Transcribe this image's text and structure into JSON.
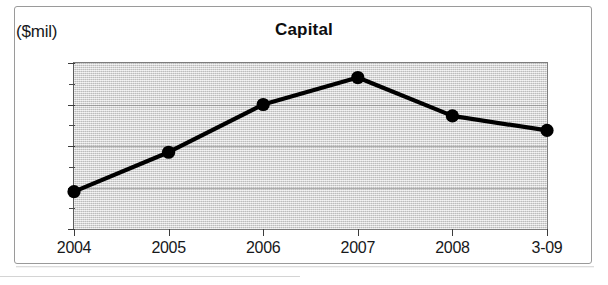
{
  "figure": {
    "unit_label": "($mil)",
    "title": "Capital"
  },
  "chart_data": {
    "type": "line",
    "title": "Capital",
    "subtitle": "",
    "xlabel": "",
    "ylabel": "($mil)",
    "unit": "$mil",
    "categories": [
      "2004",
      "2005",
      "2006",
      "2007",
      "2008",
      "3-09"
    ],
    "values": [
      138,
      157,
      180,
      193,
      174.5,
      167.5
    ],
    "series": [
      {
        "name": "Capital",
        "values": [
          138,
          157,
          180,
          193,
          174.5,
          167.5
        ]
      }
    ],
    "ylim": [
      120,
      200
    ],
    "ytick_labels": [
      "120",
      "140",
      "160",
      "180",
      "200"
    ],
    "ytick_values": [
      120,
      140,
      160,
      180,
      200
    ],
    "yminor_tick_values": [
      130,
      150,
      170,
      190
    ],
    "xtick_labels": [
      "2004",
      "2005",
      "2006",
      "2007",
      "2008",
      "3-09"
    ],
    "grid": true,
    "grid_axis": "y",
    "legend": false,
    "legend_position": "none",
    "marker": "circle",
    "line_color": "#000000",
    "marker_color": "#000000",
    "plot_background_color": "#d8d8d8",
    "figure_background_color": "#ffffff",
    "annotations": []
  }
}
